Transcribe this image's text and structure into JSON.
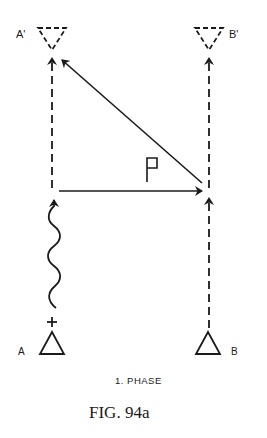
{
  "figure": {
    "caption": "FIG. 94a",
    "phase_label": "1. PHASE",
    "force_label": "P",
    "ink_color": "#1a1a1a",
    "background": "#ffffff"
  },
  "nodes": {
    "a_start": {
      "label": "A",
      "shape": "triangle-up",
      "style": "solid",
      "charge": "+"
    },
    "b_start": {
      "label": "B",
      "shape": "triangle-up",
      "style": "solid"
    },
    "a_end": {
      "label": "A'",
      "shape": "triangle-down",
      "style": "dashed"
    },
    "b_end": {
      "label": "B'",
      "shape": "triangle-down",
      "style": "dashed"
    }
  },
  "edges": [
    {
      "from": "A",
      "to": "A'",
      "style": "dashed-arrow",
      "note": "wavy segment near A"
    },
    {
      "from": "B",
      "to": "B'",
      "style": "dashed-arrow"
    },
    {
      "from": "A-line",
      "to": "B-line",
      "style": "solid-arrow",
      "label": "P"
    },
    {
      "from": "B-line",
      "to": "A'",
      "style": "solid-arrow-diagonal"
    }
  ]
}
